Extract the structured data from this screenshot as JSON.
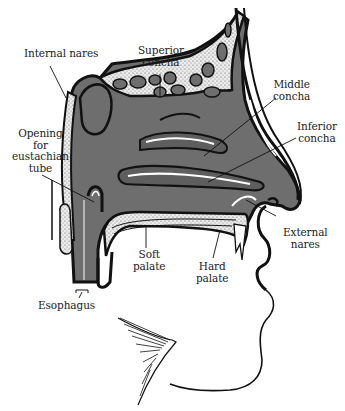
{
  "diagram": {
    "colors": {
      "cavity_fill": "#6e6e6e",
      "outline": "#111111",
      "bone_fill": "#e8e8e8",
      "background": "#ffffff"
    },
    "labels": [
      {
        "id": "internal-nares",
        "text": "Internal nares"
      },
      {
        "id": "superior-concha",
        "text": "Superior\nconcha"
      },
      {
        "id": "middle-concha",
        "text": "Middle\nconcha"
      },
      {
        "id": "inferior-concha",
        "text": "Inferior\nconcha"
      },
      {
        "id": "opening-eustachian-tube",
        "text": "Opening\nfor\neustachian\ntube"
      },
      {
        "id": "external-nares",
        "text": "External\nnares"
      },
      {
        "id": "soft-palate",
        "text": "Soft\npalate"
      },
      {
        "id": "hard-palate",
        "text": "Hard\npalate"
      },
      {
        "id": "esophagus",
        "text": "Esophagus"
      }
    ]
  }
}
